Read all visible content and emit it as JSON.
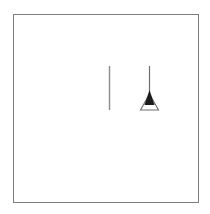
{
  "scene": {
    "title": "Framed minimal line drawing",
    "canvas_width": 210,
    "canvas_height": 214,
    "background_color": "#ffffff"
  },
  "frame": {
    "name": "border-frame",
    "x": 13,
    "y": 14,
    "width": 185,
    "height": 188,
    "stroke_color": "#7d7d7d",
    "stroke_width": 1,
    "fill_color": "#ffffff"
  },
  "figures": [
    {
      "id": "plain-vertical-line",
      "label": "Plain vertical line",
      "stroke_color": "#8c8c8c",
      "stroke_width": 1.4,
      "x": 109,
      "y_top": 66,
      "y_bottom": 110
    },
    {
      "id": "pendant-lamp",
      "label": "Pendant lamp with conical shade",
      "cord": {
        "name": "lamp-cord",
        "x": 149,
        "y_top": 66,
        "y_bottom": 97,
        "stroke_color": "#6e6e6e",
        "stroke_width": 1.2
      },
      "cone": {
        "name": "lamp-cone-dark",
        "fill_color": "#1c1c1c",
        "apex_x": 149,
        "apex_y": 90,
        "left_x": 144,
        "right_x": 154,
        "base_y": 105
      },
      "shade": {
        "name": "lamp-shade-outline",
        "stroke_color": "#6e6e6e",
        "stroke_width": 1.1,
        "fill_color": "none",
        "apex_x": 149,
        "apex_y": 94,
        "left_x": 140,
        "right_x": 158,
        "base_y": 110
      }
    }
  ],
  "colors": {
    "ink_dark": "#1c1c1c",
    "ink_gray": "#8c8c8c",
    "frame_gray": "#7d7d7d",
    "paper": "#ffffff"
  }
}
